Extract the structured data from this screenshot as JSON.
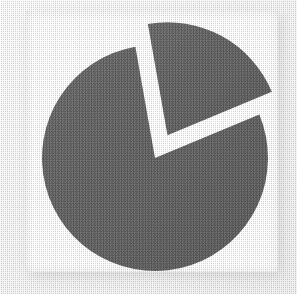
{
  "image": {
    "title": "Exploded pie chart",
    "background_color": "#f6f6f6",
    "panel_color": "#ffffff",
    "shadow_color": "#d9d9d9"
  },
  "chart_data": {
    "type": "pie",
    "title": "",
    "subtitle": "",
    "xlabel": "",
    "ylabel": "",
    "grid": false,
    "legend": "none",
    "exploded": true,
    "labels_shown": false,
    "center_x": 155,
    "center_y": 158,
    "radius": 113,
    "start_angle_deg": -100,
    "gap_color": "#ffffff",
    "categories": [
      "Slice A",
      "Slice B"
    ],
    "values": [
      21.5,
      78.5
    ],
    "angles_deg": [
      77.4,
      282.6
    ],
    "colors": [
      "#6a6a6a",
      "#6a6a6a"
    ],
    "slices": [
      {
        "name": "Slice A",
        "value": 21.5,
        "angle_deg": 77.4,
        "start_deg": -100,
        "end_deg": -22.6,
        "color": "#6a6a6a",
        "exploded": true,
        "explode_offset_px": 26
      },
      {
        "name": "Slice B",
        "value": 78.5,
        "angle_deg": 282.6,
        "start_deg": -22.6,
        "end_deg": 260,
        "color": "#6a6a6a",
        "exploded": false,
        "explode_offset_px": 0
      }
    ]
  },
  "accessibility": {
    "alt_text": "Grayscale pie chart with one wedge pulled away from the rest of the disc"
  }
}
